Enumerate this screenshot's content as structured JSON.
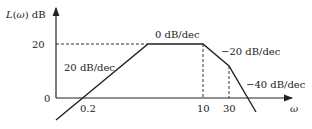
{
  "diagram": {
    "type": "bode-magnitude-asymptote",
    "y_axis_label": "L(ω) dB",
    "y_axis_label_fn": "L(",
    "y_axis_label_var": "ω",
    "y_axis_label_tail": ") dB",
    "x_axis_label": "ω",
    "y_ticks": [
      {
        "label": "20",
        "value": 20
      },
      {
        "label": "0",
        "value": 0
      }
    ],
    "x_ticks": [
      {
        "label": "0.2"
      },
      {
        "label": "10"
      },
      {
        "label": "30"
      }
    ],
    "slope_labels": [
      {
        "label": "20 dB/dec",
        "segment": "low-frequency"
      },
      {
        "label": "0 dB/dec",
        "segment": "2 to 10"
      },
      {
        "label": "−20 dB/dec",
        "segment": "10 to 30"
      },
      {
        "label": "−40 dB/dec",
        "segment": "above 30"
      }
    ],
    "colors": {
      "line": "#222222",
      "dashed": "#333333",
      "background": "#ffffff"
    }
  }
}
